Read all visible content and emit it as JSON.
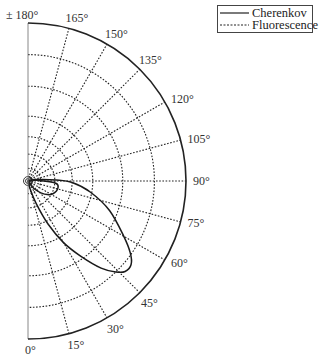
{
  "chart_data": {
    "type": "polar-line",
    "title": "",
    "angular_axis": {
      "zero_direction": "down",
      "direction": "counterclockwise-to-right",
      "range_deg": [
        0,
        180
      ],
      "tick_step_deg": 15,
      "tick_labels": [
        "0°",
        "15°",
        "30°",
        "45°",
        "60°",
        "75°",
        "90°",
        "105°",
        "120°",
        "135°",
        "150°",
        "165°",
        "± 180°"
      ]
    },
    "radial_axis": {
      "grid_rings_fraction": [
        0.03,
        0.08,
        0.17,
        0.28,
        0.41,
        0.6,
        0.8
      ],
      "scale": "non-linear (log-like)",
      "labels_visible": false
    },
    "grid": true,
    "legend": {
      "position": "top-right",
      "entries": [
        {
          "label": "Cherenkov",
          "style": "solid"
        },
        {
          "label": "Fluorescence",
          "style": "dashed"
        }
      ]
    },
    "series": [
      {
        "name": "Cherenkov",
        "style": "solid",
        "description": "Forward-peaked lobe pointing toward ~45-50°, extends to ~0.85 of the outer radius",
        "points_deg_r": [
          [
            100,
            0.05
          ],
          [
            92,
            0.18
          ],
          [
            88,
            0.28
          ],
          [
            80,
            0.4
          ],
          [
            70,
            0.55
          ],
          [
            60,
            0.7
          ],
          [
            55,
            0.79
          ],
          [
            51,
            0.84
          ],
          [
            47,
            0.84
          ],
          [
            44,
            0.8
          ],
          [
            40,
            0.72
          ],
          [
            35,
            0.58
          ],
          [
            30,
            0.45
          ],
          [
            25,
            0.3
          ],
          [
            20,
            0.15
          ],
          [
            15,
            0.05
          ]
        ],
        "inner_loop_deg_r": [
          [
            95,
            0.05
          ],
          [
            85,
            0.18
          ],
          [
            70,
            0.19
          ],
          [
            55,
            0.15
          ],
          [
            40,
            0.07
          ]
        ]
      },
      {
        "name": "Fluorescence",
        "style": "dashed",
        "description": "Isotropic emission (circle), coincides with dashed grid rings",
        "points_deg_r": []
      }
    ]
  },
  "legend": {
    "cherenkov_label": "Cherenkov",
    "fluorescence_label": "Fluorescence"
  }
}
